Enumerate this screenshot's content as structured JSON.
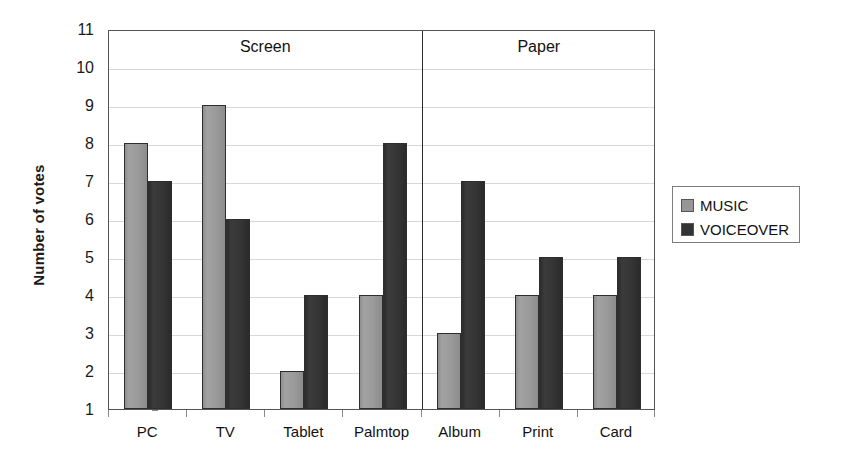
{
  "chart_data": {
    "type": "bar",
    "title": "",
    "xlabel": "",
    "ylabel": "Number of votes",
    "ylim": [
      1,
      11
    ],
    "ytick_labels": [
      "11",
      "10",
      "9",
      "8",
      "7",
      "6",
      "5",
      "4",
      "3",
      "2",
      "1"
    ],
    "grid": true,
    "legend_position": "right",
    "categories": [
      "PC",
      "TV",
      "Tablet",
      "Palmtop",
      "Album",
      "Print",
      "Card"
    ],
    "series": [
      {
        "name": "MUSIC",
        "color": "#969696",
        "values": [
          8,
          9,
          2,
          4,
          3,
          4,
          4
        ]
      },
      {
        "name": "VOICEOVER",
        "color": "#333333",
        "values": [
          7,
          6,
          4,
          8,
          7,
          5,
          5
        ]
      }
    ],
    "groups": [
      {
        "label": "Screen",
        "categories": [
          "PC",
          "TV",
          "Tablet",
          "Palmtop"
        ]
      },
      {
        "label": "Paper",
        "categories": [
          "Album",
          "Print",
          "Card"
        ]
      }
    ],
    "annotations": [
      "Screen",
      "Paper"
    ]
  },
  "legend": {
    "entries": [
      {
        "label": "MUSIC",
        "swatch": "music-swatch"
      },
      {
        "label": "VOICEOVER",
        "swatch": "voiceover-swatch"
      }
    ]
  }
}
